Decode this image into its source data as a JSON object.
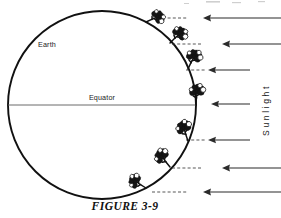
{
  "figure": {
    "caption": "FIGURE  3-9",
    "caption_plain": "FIGURE 3-9",
    "width": 281,
    "height": 218,
    "background_color": "#ffffff",
    "ink_color": "#111111"
  },
  "diagram": {
    "type": "earth-sunlight-illumination-diagram",
    "earth": {
      "label": "Earth",
      "label_x": 38,
      "label_y": 47,
      "center_x": 102,
      "center_y": 105,
      "radius": 94,
      "outline_color": "#111111",
      "fill_color": "#ffffff"
    },
    "equator": {
      "label": "Equator",
      "label_x": 102,
      "label_y": 100,
      "line_y": 105,
      "line_x1": 8,
      "line_x2": 196,
      "color": "#5a5a5a"
    },
    "sunlight": {
      "label": "Sunlight",
      "letters": [
        "S",
        "u",
        "n",
        "l",
        "i",
        "g",
        "h",
        "t"
      ],
      "orientation": "vertical-bottom-to-top",
      "x": 266,
      "y_center": 110,
      "color": "#1a1a1a"
    },
    "rays": {
      "direction": "right-to-left",
      "color": "#2b2b2b",
      "count": 7,
      "items": [
        {
          "y": 18,
          "x_start": 281,
          "x_end": 203,
          "length_class": "long"
        },
        {
          "y": 44,
          "x_start": 281,
          "x_end": 222,
          "length_class": "long"
        },
        {
          "y": 70,
          "x_start": 250,
          "x_end": 208,
          "length_class": "short"
        },
        {
          "y": 104,
          "x_start": 250,
          "x_end": 211,
          "length_class": "short"
        },
        {
          "y": 140,
          "x_start": 250,
          "x_end": 208,
          "length_class": "short"
        },
        {
          "y": 168,
          "x_start": 281,
          "x_end": 222,
          "length_class": "long"
        },
        {
          "y": 192,
          "x_start": 281,
          "x_end": 203,
          "length_class": "long"
        }
      ]
    },
    "tangent_dashes": [
      {
        "x1": 152,
        "x2": 188,
        "y": 18
      },
      {
        "x1": 172,
        "x2": 202,
        "y": 44
      },
      {
        "x1": 186,
        "x2": 205,
        "y": 70
      },
      {
        "x1": 186,
        "x2": 205,
        "y": 140
      },
      {
        "x1": 172,
        "x2": 202,
        "y": 168
      },
      {
        "x1": 152,
        "x2": 188,
        "y": 192
      }
    ],
    "trees": [
      {
        "id": "tree-1",
        "angle_deg": -62,
        "base_x": 146,
        "base_y": 22,
        "tilt_deg": -62,
        "scale": 0.92
      },
      {
        "id": "tree-2",
        "angle_deg": -42,
        "base_x": 172,
        "base_y": 42,
        "tilt_deg": -42,
        "scale": 0.98
      },
      {
        "id": "tree-3",
        "angle_deg": -22,
        "base_x": 189,
        "base_y": 69,
        "tilt_deg": -22,
        "scale": 1.0
      },
      {
        "id": "tree-4",
        "angle_deg": 0,
        "base_x": 196,
        "base_y": 104,
        "tilt_deg": 0,
        "scale": 1.0
      },
      {
        "id": "tree-5",
        "angle_deg": 22,
        "base_x": 189,
        "base_y": 140,
        "tilt_deg": 22,
        "scale": 1.0
      },
      {
        "id": "tree-6",
        "angle_deg": 42,
        "base_x": 172,
        "base_y": 167,
        "tilt_deg": 42,
        "scale": 0.98
      },
      {
        "id": "tree-7",
        "angle_deg": 62,
        "base_x": 146,
        "base_y": 187,
        "tilt_deg": 62,
        "scale": 0.92
      }
    ]
  }
}
